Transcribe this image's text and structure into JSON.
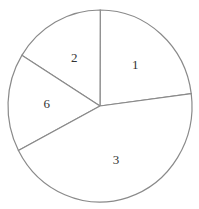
{
  "chart_data": {
    "type": "pie",
    "title": "",
    "labels": [
      "1",
      "2",
      "6",
      "3"
    ],
    "values": [
      22.9,
      16.2,
      16.5,
      44.4
    ],
    "start_angle_deg": 7.4,
    "direction": "counterclockwise",
    "slice_fill": "#ffffff",
    "stroke_color": "#8a8a8a",
    "legend": "none",
    "label_position": "inside"
  },
  "layout": {
    "cx": 100,
    "cy": 106,
    "rx": 92,
    "ry": 96,
    "label_radius_frac": 0.58
  }
}
